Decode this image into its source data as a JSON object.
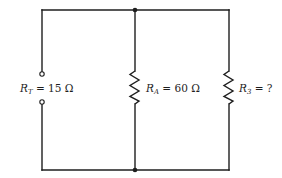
{
  "diagram": {
    "type": "parallel resistor circuit",
    "components": [
      {
        "id": "RT",
        "symbol": "R",
        "subscript": "T",
        "equals": " = ",
        "value": "15 Ω",
        "kind": "terminals (open circuit, total resistance)"
      },
      {
        "id": "RA",
        "symbol": "R",
        "subscript": "A",
        "equals": " = ",
        "value": "60 Ω",
        "kind": "resistor"
      },
      {
        "id": "R3",
        "symbol": "R",
        "subscript": "3",
        "equals": " = ",
        "value": "?",
        "kind": "resistor"
      }
    ],
    "colors": {
      "line": "#1e1e1e",
      "background": "#ffffff"
    }
  }
}
